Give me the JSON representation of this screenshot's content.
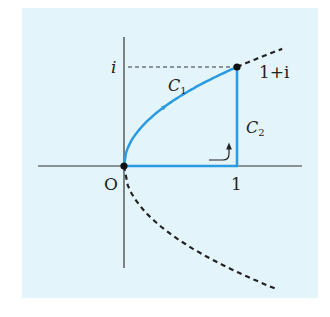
{
  "figure": {
    "background_color": "#e3f5fb",
    "axis_color": "#333333",
    "curve_color": "#2a9be0",
    "dashed_color": "#222222",
    "labels": {
      "origin": "O",
      "real_one": "1",
      "imag_i": "i",
      "endpoint": "1+i",
      "c1_letter": "C",
      "c1_sub": "1",
      "c2_letter": "C",
      "c2_sub": "2"
    },
    "points": [
      {
        "name": "origin",
        "re": 0,
        "im": 0
      },
      {
        "name": "endpoint",
        "re": 1,
        "im": 1
      }
    ],
    "paths": {
      "C1": {
        "description": "parabola arc y = sqrt(x) from 0 to 1+i",
        "x_range": [
          0,
          1
        ]
      },
      "C2": {
        "description": "polyline 0 -> 1 -> 1+i",
        "vertices": [
          [
            0,
            0
          ],
          [
            1,
            0
          ],
          [
            1,
            1
          ]
        ]
      },
      "dashed_parabola": {
        "upper_x_range": [
          1,
          1.4
        ],
        "lower_x_range": [
          0,
          1.35
        ]
      }
    }
  }
}
